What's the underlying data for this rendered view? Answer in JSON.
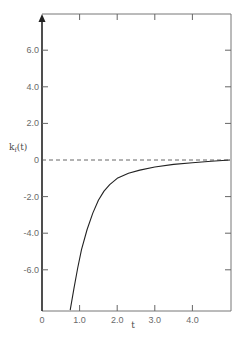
{
  "chart_data": {
    "type": "line",
    "title": "",
    "xlabel": "t",
    "ylabel": "k_f(t)",
    "xlim": [
      0,
      5.0
    ],
    "ylim": [
      -8.2,
      8.0
    ],
    "grid": false,
    "legend": null,
    "x_ticks": [
      {
        "value": 0,
        "label": "0"
      },
      {
        "value": 1.0,
        "label": "1.0"
      },
      {
        "value": 2.0,
        "label": "2.0"
      },
      {
        "value": 3.0,
        "label": "3.0"
      },
      {
        "value": 4.0,
        "label": "4.0"
      }
    ],
    "y_ticks": [
      {
        "value": 6.0,
        "label": "6.0"
      },
      {
        "value": 4.0,
        "label": "4.0"
      },
      {
        "value": 2.0,
        "label": "2.0"
      },
      {
        "value": 0,
        "label": "0"
      },
      {
        "value": -2.0,
        "label": "-2.0"
      },
      {
        "value": -4.0,
        "label": "-4.0"
      },
      {
        "value": -6.0,
        "label": "-6.0"
      }
    ],
    "reference_lines": [
      {
        "orientation": "horizontal",
        "y": 0,
        "style": "dashed"
      }
    ],
    "series": [
      {
        "name": "k_f(t)",
        "x": [
          0.75,
          0.85,
          0.95,
          1.05,
          1.2,
          1.35,
          1.5,
          1.65,
          1.8,
          2.0,
          2.3,
          2.6,
          3.0,
          3.5,
          4.0,
          4.5,
          5.0
        ],
        "y": [
          -8.2,
          -7.0,
          -5.9,
          -4.9,
          -3.8,
          -2.9,
          -2.2,
          -1.7,
          -1.35,
          -1.0,
          -0.72,
          -0.55,
          -0.38,
          -0.24,
          -0.15,
          -0.07,
          0.0
        ]
      }
    ]
  },
  "labels": {
    "xlabel": "t",
    "ylabel_main": "k",
    "ylabel_sub": "f",
    "ylabel_arg": "(t)"
  }
}
